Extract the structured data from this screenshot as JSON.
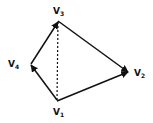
{
  "diagram": {
    "type": "directed-graph",
    "vertices": [
      {
        "id": "v1",
        "label": "V",
        "sub": "1",
        "x": 57,
        "y": 101
      },
      {
        "id": "v2",
        "label": "V",
        "sub": "2",
        "x": 128,
        "y": 72
      },
      {
        "id": "v3",
        "label": "V",
        "sub": "3",
        "x": 58,
        "y": 21
      },
      {
        "id": "v4",
        "label": "V",
        "sub": "4",
        "x": 31,
        "y": 64
      }
    ],
    "edges": [
      {
        "from": "v4",
        "to": "v3",
        "style": "solid",
        "arrow": "v3"
      },
      {
        "from": "v1",
        "to": "v4",
        "style": "solid",
        "arrow": "v4"
      },
      {
        "from": "v3",
        "to": "v2",
        "style": "solid",
        "arrow": "v2"
      },
      {
        "from": "v1",
        "to": "v2",
        "style": "solid",
        "arrow": "v2"
      },
      {
        "from": "v3",
        "to": "v1",
        "style": "dashed",
        "arrow": "none"
      }
    ],
    "line_color": "#111111"
  }
}
